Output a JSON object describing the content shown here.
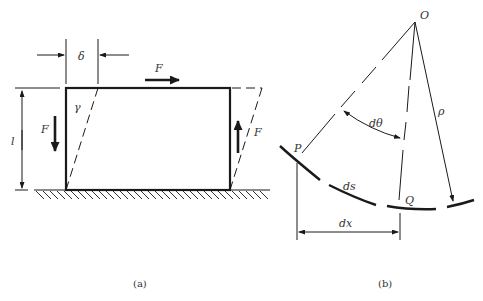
{
  "figure": {
    "panel_a": {
      "caption": "(a)",
      "labels": {
        "delta": "δ",
        "gamma": "γ",
        "length": "l",
        "force_top": "F",
        "force_left": "F",
        "force_right": "F"
      }
    },
    "panel_b": {
      "caption": "(b)",
      "labels": {
        "origin": "O",
        "point_p": "P",
        "point_q": "Q",
        "angle": "dθ",
        "radius": "ρ",
        "arc_length": "ds",
        "horizontal": "dx"
      }
    },
    "colors": {
      "stroke": "#1a1a1a",
      "text": "#333333",
      "background": "#ffffff"
    }
  }
}
